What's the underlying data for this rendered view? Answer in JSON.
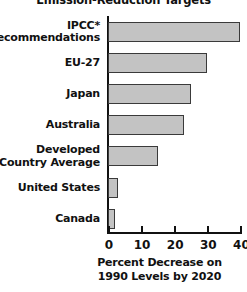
{
  "chart_data": {
    "type": "bar",
    "orientation": "horizontal",
    "title": "Emission-Reduction Targets",
    "xlabel": "Percent Decrease on 1990 Levels by 2020",
    "xlabel_lines": [
      "Percent Decrease on",
      "1990 Levels by 2020"
    ],
    "ylabel": "",
    "categories": [
      "IPCC*\nRecommendations",
      "EU-27",
      "Japan",
      "Australia",
      "Developed\nCountry Average",
      "United States",
      "Canada"
    ],
    "values": [
      40,
      30,
      25,
      23,
      15,
      3,
      2
    ],
    "xlim": [
      0,
      40
    ],
    "xticks": [
      0,
      10,
      20,
      30,
      40
    ],
    "xtick_labels": [
      "0",
      "10",
      "20",
      "30",
      "40"
    ],
    "grid": false,
    "legend": false,
    "bar_fill_color": "#c3c3c3",
    "bar_edge_color": "#3a3a3a",
    "axis_color": "#111111",
    "background_color": "#ffffff",
    "footnote_marker": "*"
  }
}
